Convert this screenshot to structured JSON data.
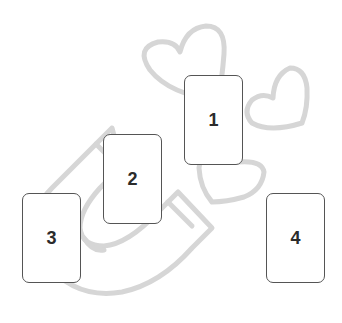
{
  "spread": {
    "background_color": "#ffffff",
    "line_art_color": "#d6d6d6",
    "card_border_color": "#555555",
    "card_number_color": "#2b2b2b",
    "decorations": [
      {
        "type": "magnet-icon",
        "description": "horseshoe magnet outline, tilted"
      },
      {
        "type": "heart-icon",
        "description": "large heart outline, top center"
      },
      {
        "type": "heart-icon",
        "description": "medium heart outline, right"
      },
      {
        "type": "heart-icon",
        "description": "small heart outline, below card 1"
      }
    ],
    "cards": [
      {
        "label": "1",
        "x": 184,
        "y": 75
      },
      {
        "label": "2",
        "x": 103,
        "y": 134
      },
      {
        "label": "3",
        "x": 22,
        "y": 193
      },
      {
        "label": "4",
        "x": 266,
        "y": 193
      }
    ]
  }
}
